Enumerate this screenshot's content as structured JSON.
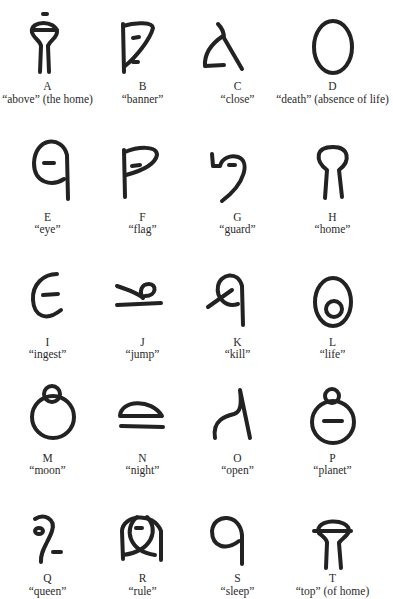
{
  "glyphs": [
    {
      "letter": "A",
      "meaning": "“above” (the home)",
      "icon": "glyph-above-icon"
    },
    {
      "letter": "B",
      "meaning": "“banner”",
      "icon": "glyph-banner-icon"
    },
    {
      "letter": "C",
      "meaning": "“close”",
      "icon": "glyph-close-icon"
    },
    {
      "letter": "D",
      "meaning": "“death” (absence of life)",
      "icon": "glyph-death-icon"
    },
    {
      "letter": "E",
      "meaning": "“eye”",
      "icon": "glyph-eye-icon"
    },
    {
      "letter": "F",
      "meaning": "“flag”",
      "icon": "glyph-flag-icon"
    },
    {
      "letter": "G",
      "meaning": "“guard”",
      "icon": "glyph-guard-icon"
    },
    {
      "letter": "H",
      "meaning": "“home”",
      "icon": "glyph-home-icon"
    },
    {
      "letter": "I",
      "meaning": "“ingest”",
      "icon": "glyph-ingest-icon"
    },
    {
      "letter": "J",
      "meaning": "“jump”",
      "icon": "glyph-jump-icon"
    },
    {
      "letter": "K",
      "meaning": "“kill”",
      "icon": "glyph-kill-icon"
    },
    {
      "letter": "L",
      "meaning": "“life”",
      "icon": "glyph-life-icon"
    },
    {
      "letter": "M",
      "meaning": "“moon”",
      "icon": "glyph-moon-icon"
    },
    {
      "letter": "N",
      "meaning": "“night”",
      "icon": "glyph-night-icon"
    },
    {
      "letter": "O",
      "meaning": "“open”",
      "icon": "glyph-open-icon"
    },
    {
      "letter": "P",
      "meaning": "“planet”",
      "icon": "glyph-planet-icon"
    },
    {
      "letter": "Q",
      "meaning": "“queen”",
      "icon": "glyph-queen-icon"
    },
    {
      "letter": "R",
      "meaning": "“rule”",
      "icon": "glyph-rule-icon"
    },
    {
      "letter": "S",
      "meaning": "“sleep”",
      "icon": "glyph-sleep-icon"
    },
    {
      "letter": "T",
      "meaning": "“top” (of home)",
      "icon": "glyph-top-icon"
    }
  ]
}
